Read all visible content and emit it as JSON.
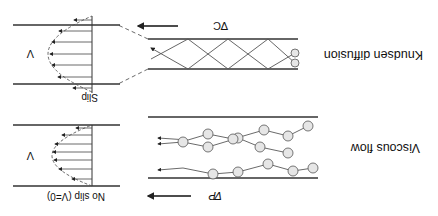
{
  "orientation": "rotated-180",
  "panels": {
    "knudsen": {
      "title": "Knudsen diffusion",
      "gradient_label": "∇C",
      "profile_label": "V",
      "wall_label": "Slip"
    },
    "viscous": {
      "title": "Viscous flow",
      "gradient_label": "∇P",
      "profile_label": "V",
      "wall_label": "No slip (V=0)"
    }
  },
  "colors": {
    "line": "#333333",
    "particle_fill": "#e6e6e6",
    "particle_stroke": "#555555"
  }
}
